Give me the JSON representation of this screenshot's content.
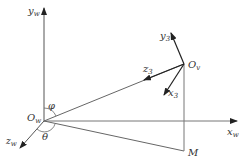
{
  "diagram": {
    "axes": {
      "yw": {
        "label": "y",
        "sub": "w"
      },
      "xw": {
        "label": "x",
        "sub": "w"
      },
      "zw": {
        "label": "z",
        "sub": "w"
      },
      "y3": {
        "label": "y",
        "sub": "3"
      },
      "z3": {
        "label": "z",
        "sub": "3"
      },
      "x3": {
        "label": "x",
        "sub": "3"
      }
    },
    "points": {
      "Ow": {
        "label": "O",
        "sub": "w"
      },
      "Ov": {
        "label": "O",
        "sub": "v"
      },
      "M": {
        "label": "M"
      }
    },
    "angles": {
      "phi": "φ",
      "theta": "θ"
    },
    "colors": {
      "line": "#555555",
      "text": "#333333"
    }
  }
}
